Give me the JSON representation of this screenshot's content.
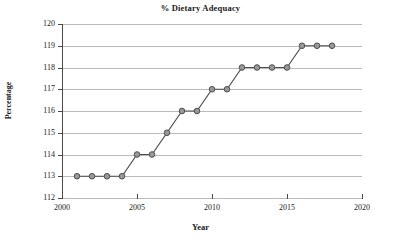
{
  "chart_data": {
    "type": "line",
    "title": "% Dietary Adequacy",
    "xlabel": "Year",
    "ylabel": "Percentage",
    "grid": true,
    "legend": "none",
    "xlim": [
      2000,
      2020
    ],
    "ylim": [
      112,
      120
    ],
    "x_ticks": [
      2000,
      2005,
      2010,
      2015,
      2020
    ],
    "y_ticks": [
      112,
      113,
      114,
      115,
      116,
      117,
      118,
      119,
      120
    ],
    "x": [
      2001,
      2002,
      2003,
      2004,
      2005,
      2006,
      2007,
      2008,
      2009,
      2010,
      2011,
      2012,
      2013,
      2014,
      2015,
      2016,
      2017,
      2018
    ],
    "values": [
      113,
      113,
      113,
      113,
      114,
      114,
      115,
      116,
      116,
      117,
      117,
      118,
      118,
      118,
      118,
      119,
      119,
      119
    ],
    "series": [
      {
        "name": "% Dietary Adequacy",
        "values": [
          113,
          113,
          113,
          113,
          114,
          114,
          115,
          116,
          116,
          117,
          117,
          118,
          118,
          118,
          118,
          119,
          119,
          119
        ]
      }
    ],
    "marker": "circle",
    "marker_fill": "#999999",
    "marker_edge": "#4d4d4d",
    "line_color": "#4d4d4d",
    "grid_color": "#b9b9b9",
    "axis_color": "#4a4a4a",
    "background": "#ffffff"
  }
}
